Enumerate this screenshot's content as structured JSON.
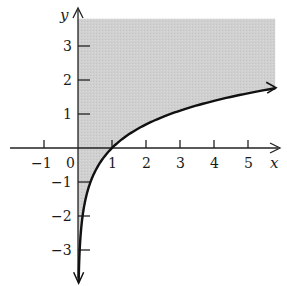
{
  "chart_data": {
    "type": "line",
    "title": "",
    "function": "y = ln x",
    "xlabel": "x",
    "ylabel": "y",
    "xlim": [
      -2.0,
      6.0
    ],
    "ylim": [
      -4.0,
      4.0
    ],
    "x_ticks": [
      -1,
      1,
      2,
      3,
      4,
      5
    ],
    "x_tick_labels": [
      "−1",
      "1",
      "2",
      "3",
      "4",
      "5"
    ],
    "origin_label": "0",
    "y_ticks": [
      3,
      2,
      1,
      -1,
      -2,
      -3
    ],
    "y_tick_labels": [
      "3",
      "2",
      "1",
      "−1",
      "−2",
      "−3"
    ],
    "grid": false,
    "legend": null,
    "series": [
      {
        "name": "ln x",
        "x": [
          0.02,
          0.05,
          0.1,
          0.2,
          0.3,
          0.5,
          0.7,
          1,
          1.5,
          2,
          2.5,
          3,
          3.5,
          4,
          4.5,
          5,
          5.8
        ],
        "values": [
          -3.91,
          -3.0,
          -2.3,
          -1.61,
          -1.2,
          -0.69,
          -0.36,
          0,
          0.41,
          0.69,
          0.92,
          1.1,
          1.25,
          1.39,
          1.5,
          1.61,
          1.76
        ]
      }
    ],
    "shaded_region": {
      "description": "Region with x > 0 above the curve y = ln x",
      "color": "#cfcfcf",
      "x_range": [
        0,
        5.8
      ],
      "y_top": 3.8
    },
    "colors": {
      "curve": "#111111",
      "axes": "#222222",
      "shade": "#cfcfcf"
    }
  }
}
